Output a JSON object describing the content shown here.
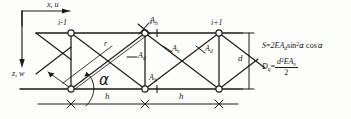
{
  "figure": {
    "type": "truss-lattice-diagram",
    "background": "#fdfdfb",
    "ink": "#1a1a1a",
    "axes": {
      "horizontal_label": "x, u",
      "vertical_label": "z, w"
    },
    "nodes": [
      {
        "id": "n-left",
        "label": "i-1"
      },
      {
        "id": "n-center",
        "label": "i"
      },
      {
        "id": "n-right",
        "label": "i+1"
      }
    ],
    "members": {
      "chord_top_label": "A",
      "chord_top_sub": "h",
      "chord_bottom_label": "A",
      "chord_bottom_sub": "h",
      "vertical_label": "A",
      "vertical_sub": "v",
      "diagonal_label": "A",
      "diagonal_sub": "d",
      "diagonal_right_label": "A",
      "diagonal_right_sub": "d"
    },
    "dimensions": {
      "bay_1": "h",
      "bay_2": "h",
      "depth": "d",
      "diagonal_length": "r",
      "angle": "α"
    },
    "formulas": [
      {
        "id": "shear-stiffness",
        "lhs": "S",
        "eq": "=",
        "rhs_plain": "2EA",
        "rhs_sub": "d",
        "trig": "sin",
        "trig_pow": "2",
        "trig_arg": "α",
        "tail": "cos",
        "tail_arg": "α"
      },
      {
        "id": "bending-stiffness",
        "lhs": "D",
        "lhs_sub": "q",
        "eq": "=",
        "num_plain": "d",
        "num_pow": "2",
        "num_rest": "EA",
        "num_sub": "s",
        "den": "2"
      }
    ]
  }
}
